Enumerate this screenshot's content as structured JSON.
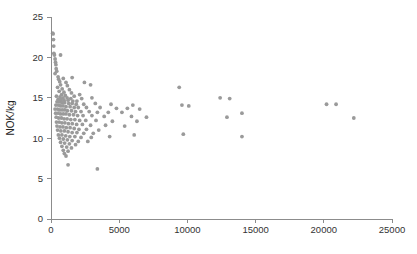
{
  "chart_data": {
    "type": "scatter",
    "title": "",
    "subtitle": "",
    "xlabel": "",
    "ylabel": "NOK/kg",
    "xlim": [
      0,
      25000
    ],
    "ylim": [
      0,
      25
    ],
    "grid": false,
    "legend": null,
    "x_ticks": [
      0,
      5000,
      10000,
      15000,
      20000,
      25000
    ],
    "x_tick_labels": [
      "0",
      "5000",
      "10000",
      "15000",
      "20000",
      "25000"
    ],
    "y_ticks": [
      0,
      5,
      10,
      15,
      20,
      25
    ],
    "y_tick_labels": [
      "0",
      "5",
      "10",
      "15",
      "20",
      "25"
    ],
    "marker": {
      "shape": "circle",
      "color": "#9a9a9a",
      "radius_px": 1.9
    },
    "series": [
      {
        "name": "observations",
        "points": [
          [
            120,
            23.0
          ],
          [
            150,
            22.9
          ],
          [
            180,
            22.2
          ],
          [
            200,
            21.4
          ],
          [
            210,
            20.5
          ],
          [
            250,
            20.3
          ],
          [
            700,
            20.3
          ],
          [
            300,
            19.8
          ],
          [
            330,
            19.4
          ],
          [
            360,
            19.1
          ],
          [
            380,
            18.6
          ],
          [
            420,
            18.3
          ],
          [
            300,
            18.0
          ],
          [
            520,
            17.6
          ],
          [
            560,
            17.3
          ],
          [
            900,
            17.4
          ],
          [
            1550,
            17.5
          ],
          [
            640,
            17.0
          ],
          [
            1100,
            16.9
          ],
          [
            2450,
            16.9
          ],
          [
            700,
            16.6
          ],
          [
            1200,
            16.5
          ],
          [
            2900,
            16.6
          ],
          [
            480,
            16.3
          ],
          [
            820,
            16.1
          ],
          [
            1350,
            16.0
          ],
          [
            600,
            15.8
          ],
          [
            950,
            15.7
          ],
          [
            1500,
            15.6
          ],
          [
            2100,
            15.4
          ],
          [
            9400,
            16.3
          ],
          [
            780,
            15.4
          ],
          [
            1050,
            15.3
          ],
          [
            1700,
            15.2
          ],
          [
            400,
            15.2
          ],
          [
            660,
            15.1
          ],
          [
            880,
            15.0
          ],
          [
            1180,
            15.0
          ],
          [
            1450,
            14.9
          ],
          [
            2250,
            14.9
          ],
          [
            3000,
            15.0
          ],
          [
            520,
            14.8
          ],
          [
            740,
            14.8
          ],
          [
            960,
            14.7
          ],
          [
            1250,
            14.7
          ],
          [
            1600,
            14.6
          ],
          [
            1900,
            14.6
          ],
          [
            12400,
            15.0
          ],
          [
            13100,
            14.9
          ],
          [
            20200,
            14.2
          ],
          [
            20900,
            14.2
          ],
          [
            440,
            14.5
          ],
          [
            620,
            14.5
          ],
          [
            800,
            14.4
          ],
          [
            1000,
            14.4
          ],
          [
            1300,
            14.3
          ],
          [
            1550,
            14.3
          ],
          [
            1850,
            14.2
          ],
          [
            2400,
            14.2
          ],
          [
            3250,
            14.3
          ],
          [
            4400,
            14.2
          ],
          [
            6000,
            14.1
          ],
          [
            9600,
            14.1
          ],
          [
            10100,
            14.0
          ],
          [
            360,
            14.1
          ],
          [
            540,
            14.1
          ],
          [
            700,
            14.0
          ],
          [
            880,
            14.0
          ],
          [
            1100,
            13.9
          ],
          [
            1400,
            13.9
          ],
          [
            1700,
            13.8
          ],
          [
            2000,
            13.8
          ],
          [
            2600,
            13.8
          ],
          [
            3600,
            13.8
          ],
          [
            4800,
            13.7
          ],
          [
            5600,
            13.7
          ],
          [
            6500,
            13.6
          ],
          [
            22200,
            12.5
          ],
          [
            300,
            13.6
          ],
          [
            480,
            13.6
          ],
          [
            640,
            13.5
          ],
          [
            820,
            13.5
          ],
          [
            1000,
            13.5
          ],
          [
            1200,
            13.4
          ],
          [
            1500,
            13.4
          ],
          [
            1800,
            13.3
          ],
          [
            2200,
            13.3
          ],
          [
            2800,
            13.3
          ],
          [
            3400,
            13.2
          ],
          [
            4200,
            13.2
          ],
          [
            5200,
            13.2
          ],
          [
            14000,
            13.1
          ],
          [
            340,
            13.1
          ],
          [
            520,
            13.1
          ],
          [
            700,
            13.0
          ],
          [
            900,
            13.0
          ],
          [
            1100,
            13.0
          ],
          [
            1350,
            12.9
          ],
          [
            1650,
            12.9
          ],
          [
            1950,
            12.8
          ],
          [
            2350,
            12.8
          ],
          [
            3000,
            12.8
          ],
          [
            3900,
            12.7
          ],
          [
            5900,
            12.7
          ],
          [
            7000,
            12.6
          ],
          [
            12900,
            12.6
          ],
          [
            380,
            12.6
          ],
          [
            560,
            12.5
          ],
          [
            760,
            12.5
          ],
          [
            960,
            12.4
          ],
          [
            1180,
            12.4
          ],
          [
            1450,
            12.3
          ],
          [
            1750,
            12.3
          ],
          [
            2100,
            12.2
          ],
          [
            2550,
            12.2
          ],
          [
            3300,
            12.2
          ],
          [
            4500,
            12.1
          ],
          [
            6300,
            12.1
          ],
          [
            400,
            12.0
          ],
          [
            600,
            12.0
          ],
          [
            800,
            11.9
          ],
          [
            1020,
            11.9
          ],
          [
            1280,
            11.8
          ],
          [
            1560,
            11.8
          ],
          [
            1880,
            11.7
          ],
          [
            2300,
            11.7
          ],
          [
            2900,
            11.6
          ],
          [
            4000,
            11.6
          ],
          [
            5400,
            11.5
          ],
          [
            440,
            11.5
          ],
          [
            660,
            11.4
          ],
          [
            880,
            11.4
          ],
          [
            1120,
            11.3
          ],
          [
            1400,
            11.3
          ],
          [
            1700,
            11.2
          ],
          [
            2050,
            11.1
          ],
          [
            2600,
            11.1
          ],
          [
            3500,
            11.0
          ],
          [
            480,
            11.0
          ],
          [
            720,
            10.9
          ],
          [
            980,
            10.9
          ],
          [
            1250,
            10.8
          ],
          [
            1550,
            10.7
          ],
          [
            1900,
            10.7
          ],
          [
            2400,
            10.6
          ],
          [
            3100,
            10.6
          ],
          [
            9700,
            10.5
          ],
          [
            14000,
            10.2
          ],
          [
            540,
            10.4
          ],
          [
            800,
            10.4
          ],
          [
            1080,
            10.3
          ],
          [
            1380,
            10.2
          ],
          [
            1750,
            10.2
          ],
          [
            2200,
            10.1
          ],
          [
            2950,
            10.1
          ],
          [
            4300,
            10.2
          ],
          [
            6100,
            10.4
          ],
          [
            620,
            10.0
          ],
          [
            900,
            9.9
          ],
          [
            1200,
            9.8
          ],
          [
            1550,
            9.7
          ],
          [
            2000,
            9.6
          ],
          [
            2700,
            9.6
          ],
          [
            700,
            9.5
          ],
          [
            1000,
            9.4
          ],
          [
            1350,
            9.3
          ],
          [
            1800,
            9.2
          ],
          [
            800,
            9.0
          ],
          [
            1150,
            8.9
          ],
          [
            1500,
            8.8
          ],
          [
            900,
            8.5
          ],
          [
            1250,
            8.4
          ],
          [
            980,
            8.1
          ],
          [
            1100,
            7.8
          ],
          [
            1250,
            6.7
          ],
          [
            3400,
            6.2
          ]
        ]
      }
    ]
  },
  "plot_geometry": {
    "x_origin_px": 51,
    "y_origin_px": 219,
    "x_max_px": 392,
    "y_max_px": 17
  }
}
